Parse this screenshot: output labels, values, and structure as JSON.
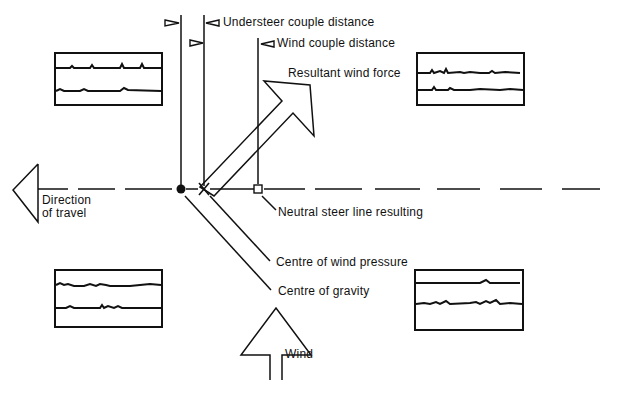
{
  "labels": {
    "understeer_couple_distance": "Understeer couple distance",
    "wind_couple_distance": "Wind couple distance",
    "resultant_wind_force": "Resultant wind force",
    "direction_of_travel_line1": "Direction",
    "direction_of_travel_line2": "of travel",
    "neutral_steer_line": "Neutral steer line resulting",
    "centre_of_wind_pressure": "Centre of wind pressure",
    "centre_of_gravity": "Centre of gravity",
    "wind": "Wind"
  },
  "colors": {
    "ink": "#111111",
    "background": "#ffffff"
  },
  "wheels": [
    {
      "position": "front-left",
      "x": 55,
      "y": 53,
      "w": 107,
      "h": 52
    },
    {
      "position": "front-right",
      "x": 417,
      "y": 53,
      "w": 107,
      "h": 52
    },
    {
      "position": "rear-left",
      "x": 55,
      "y": 270,
      "w": 107,
      "h": 57
    },
    {
      "position": "rear-right",
      "x": 415,
      "y": 270,
      "w": 108,
      "h": 60
    }
  ]
}
